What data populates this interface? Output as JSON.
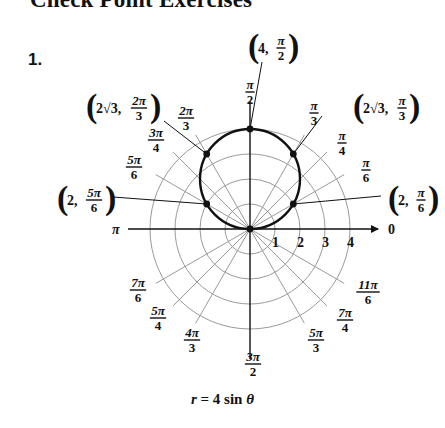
{
  "header": {
    "title": "Check Point Exercises",
    "exercise_number": "1."
  },
  "graph": {
    "equation": "r = 4 sin θ",
    "equation_parts": {
      "r": "r",
      "eq": " = 4 sin ",
      "theta": "θ"
    },
    "origin": [
      250,
      229
    ],
    "unit_px": 25,
    "rings": [
      1,
      2,
      3,
      4
    ],
    "ring_labels": [
      "1",
      "2",
      "3",
      "4"
    ],
    "zero_axis_label": "0",
    "pi_axis_label": "π",
    "colors": {
      "grid": "#9a9a9a",
      "axis": "#111111",
      "curve": "#111111"
    },
    "angle_labels": [
      {
        "deg": 90,
        "num": "π",
        "den": "2",
        "x": 250,
        "y": 92
      },
      {
        "deg": 60,
        "num": "π",
        "den": "3",
        "x": 314,
        "y": 113
      },
      {
        "deg": 45,
        "num": "π",
        "den": "4",
        "x": 342,
        "y": 143
      },
      {
        "deg": 30,
        "num": "π",
        "den": "6",
        "x": 366,
        "y": 170
      },
      {
        "deg": 120,
        "num": "2π",
        "den": "3",
        "x": 186,
        "y": 118
      },
      {
        "deg": 135,
        "num": "3π",
        "den": "4",
        "x": 156,
        "y": 140
      },
      {
        "deg": 150,
        "num": "5π",
        "den": "6",
        "x": 134,
        "y": 167
      },
      {
        "deg": 210,
        "num": "7π",
        "den": "6",
        "x": 138,
        "y": 290
      },
      {
        "deg": 225,
        "num": "5π",
        "den": "4",
        "x": 158,
        "y": 318
      },
      {
        "deg": 240,
        "num": "4π",
        "den": "3",
        "x": 192,
        "y": 340
      },
      {
        "deg": 270,
        "num": "3π",
        "den": "2",
        "x": 253,
        "y": 364
      },
      {
        "deg": 300,
        "num": "5π",
        "den": "3",
        "x": 316,
        "y": 340
      },
      {
        "deg": 315,
        "num": "7π",
        "den": "4",
        "x": 345,
        "y": 320
      },
      {
        "deg": 330,
        "num": "11π",
        "den": "6",
        "x": 368,
        "y": 292
      }
    ],
    "point_labels": [
      {
        "text_a": "4,",
        "num": "π",
        "den": "2",
        "x": 270,
        "y": 48,
        "deg": 90,
        "r": 4
      },
      {
        "text_a": "2√3,",
        "num": "2π",
        "den": "3",
        "x": 120,
        "y": 108,
        "deg": 120,
        "r": 3.464
      },
      {
        "text_a": "2√3,",
        "num": "π",
        "den": "3",
        "x": 383,
        "y": 108,
        "deg": 60,
        "r": 3.464
      },
      {
        "text_a": "2,",
        "num": "5π",
        "den": "6",
        "x": 83,
        "y": 200,
        "deg": 150,
        "r": 2
      },
      {
        "text_a": "2,",
        "num": "π",
        "den": "6",
        "x": 410,
        "y": 200,
        "deg": 30,
        "r": 2
      }
    ],
    "plotted_points": [
      {
        "deg": 0,
        "r": 0
      },
      {
        "deg": 30,
        "r": 2
      },
      {
        "deg": 60,
        "r": 3.464
      },
      {
        "deg": 90,
        "r": 4
      },
      {
        "deg": 120,
        "r": 3.464
      },
      {
        "deg": 150,
        "r": 2
      }
    ]
  }
}
